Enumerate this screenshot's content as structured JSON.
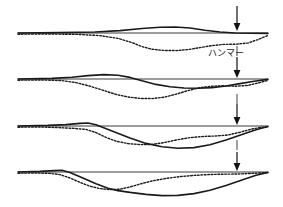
{
  "figure": {
    "annotation_label": "ハンマー",
    "annotation_label_x": 226,
    "annotation_label_y": 56,
    "arrow_x": 237,
    "colors": {
      "ground_curve": "#1a1a1a",
      "settlement_curve": "#1a1a1a",
      "baseline": "#3a3a3a",
      "arrow": "#111111",
      "background": "#ffffff"
    },
    "panels": [
      {
        "name": "panel-stage-1",
        "baseline_y": 33,
        "baseline_x0": 18,
        "baseline_x1": 268,
        "arrow_top": 6,
        "arrow_tip": 30,
        "tick_top": 46,
        "tick_bottom": 56,
        "ground_path": "M18,33 L60,32.6 L95,32.0 L120,30.6 L142,28.5 L160,27.2 L175,27.0 L190,28.0 L205,30.2 L220,32.0 L235,33.0 L250,33.3 L268,33.4",
        "settle_path": "M18,34.2 L50,34.0 L78,34.4 L100,35.6 L118,38.4 L132,42.6 L142,46.6 L152,49.2 L163,50.4 L176,50.6 L188,49.6 L200,47.6 L212,45.6 L224,44.4 L236,44.2 L248,43.0 L258,39.6 L268,35.4"
      },
      {
        "name": "panel-stage-2",
        "baseline_y": 79,
        "baseline_x0": 18,
        "baseline_x1": 268,
        "arrow_top": 57,
        "arrow_tip": 77,
        "tick_top": 94,
        "tick_bottom": 104,
        "ground_path": "M18,79 L52,78.4 L72,77.2 L88,75.6 L104,74.6 L118,75.2 L130,77.4 L142,80.8 L156,84.4 L170,86.8 L184,88.0 L198,88.2 L212,87.6 L226,86.0 L240,83.6 L254,81.2 L268,79.4",
        "settle_path": "M18,80.2 L44,80.0 L62,80.6 L76,82.6 L90,86.2 L104,90.6 L116,94.4 L128,97.0 L140,98.4 L152,98.6 L164,97.2 L176,94.2 L188,90.6 L200,87.6 L212,86.2 L224,85.8 L236,86.2 L248,85.4 L258,83.0 L268,80.4"
      },
      {
        "name": "panel-stage-3",
        "baseline_y": 126,
        "baseline_x0": 18,
        "baseline_x1": 268,
        "arrow_top": 104,
        "arrow_tip": 124,
        "tick_top": 140,
        "tick_bottom": 150,
        "ground_path": "M18,126 L48,125.4 L66,124.6 L80,123.4 L88,123.0 L96,124.8 L112,131.0 L130,138.0 L146,143.4 L162,146.8 L178,148.2 L194,147.6 L210,144.8 L226,140.0 L242,134.6 L256,129.8 L268,126.4",
        "settle_path": "M18,127.2 L40,127.0 L58,127.6 L74,128.4 L86,129.4 L96,132.6 L106,137.4 L116,141.2 L128,143.6 L140,144.6 L152,144.4 L164,142.6 L176,140.0 L190,137.6 L204,136.4 L216,136.0 L228,135.0 L240,132.2 L252,129.0 L262,127.2 L268,126.8"
      },
      {
        "name": "panel-stage-4",
        "baseline_y": 172,
        "baseline_x0": 18,
        "baseline_x1": 268,
        "arrow_top": 152,
        "arrow_tip": 170,
        "tick_top": 186,
        "tick_bottom": 196,
        "ground_path": "M18,172 L40,171.4 L54,170.6 L62,170.2 L70,172.4 L84,178.6 L96,183.8 L108,188.2 L118,190.6 L130,192.4 L146,194.4 L162,195.6 L178,195.4 L194,193.6 L210,190.2 L226,185.4 L242,180.0 L256,175.2 L268,172.4",
        "settle_path": "M18,173.2 L36,173.0 L50,173.4 L60,174.6 L70,178.0 L80,182.4 L90,186.2 L100,188.6 L110,189.6 L120,189.2 L130,187.0 L140,184.0 L152,181.0 L166,178.4 L180,176.6 L194,175.4 L208,174.6 L222,174.2 L238,174.0 L252,173.4 L268,172.6"
      }
    ]
  }
}
